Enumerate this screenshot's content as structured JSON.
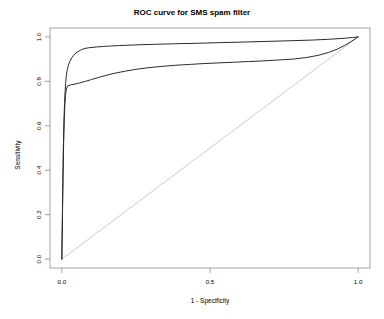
{
  "chart_data": {
    "type": "line",
    "title": "ROC curve for SMS spam filter",
    "xlabel": "1 - Specificity",
    "ylabel": "Sensitivity",
    "xlim": [
      -0.04,
      1.04
    ],
    "ylim": [
      -0.04,
      1.04
    ],
    "grid": false,
    "legend": "none",
    "xticks": [
      "0.0",
      "0.5",
      "1.0"
    ],
    "xtick_values": [
      0.0,
      0.5,
      1.0
    ],
    "yticks": [
      "0.0",
      "0.2",
      "0.4",
      "0.6",
      "0.8",
      "1.0"
    ],
    "ytick_values": [
      0.0,
      0.2,
      0.4,
      0.6,
      0.8,
      1.0
    ],
    "series": [
      {
        "name": "ROC curve A",
        "color": "#2b2b2b",
        "x": [
          0.0,
          0.003,
          0.005,
          0.007,
          0.009,
          0.011,
          0.013,
          0.015,
          0.018,
          0.022,
          0.027,
          0.033,
          0.04,
          0.048,
          0.057,
          0.067,
          0.078,
          0.09,
          0.105,
          0.12,
          0.14,
          0.165,
          0.195,
          0.23,
          0.27,
          0.32,
          0.38,
          0.45,
          0.53,
          0.62,
          0.7,
          0.78,
          0.85,
          0.91,
          0.955,
          0.98,
          1.0
        ],
        "y": [
          0.0,
          0.3,
          0.5,
          0.62,
          0.7,
          0.755,
          0.795,
          0.825,
          0.85,
          0.872,
          0.89,
          0.905,
          0.918,
          0.928,
          0.936,
          0.943,
          0.948,
          0.951,
          0.953,
          0.955,
          0.957,
          0.959,
          0.961,
          0.963,
          0.965,
          0.967,
          0.969,
          0.971,
          0.974,
          0.977,
          0.98,
          0.983,
          0.986,
          0.99,
          0.994,
          0.997,
          1.0
        ]
      },
      {
        "name": "ROC curve B",
        "color": "#2b2b2b",
        "x": [
          0.0,
          0.002,
          0.004,
          0.006,
          0.008,
          0.01,
          0.012,
          0.015,
          0.02,
          0.03,
          0.045,
          0.06,
          0.08,
          0.1,
          0.125,
          0.15,
          0.18,
          0.215,
          0.25,
          0.29,
          0.335,
          0.38,
          0.43,
          0.48,
          0.53,
          0.58,
          0.63,
          0.68,
          0.73,
          0.78,
          0.825,
          0.865,
          0.9,
          0.93,
          0.955,
          0.975,
          0.99,
          1.0
        ],
        "y": [
          0.0,
          0.2,
          0.38,
          0.52,
          0.62,
          0.69,
          0.735,
          0.765,
          0.78,
          0.784,
          0.788,
          0.793,
          0.8,
          0.808,
          0.818,
          0.827,
          0.837,
          0.846,
          0.854,
          0.861,
          0.867,
          0.872,
          0.876,
          0.88,
          0.883,
          0.886,
          0.889,
          0.892,
          0.896,
          0.9,
          0.907,
          0.917,
          0.93,
          0.945,
          0.962,
          0.978,
          0.991,
          1.0
        ]
      }
    ],
    "reference_line": {
      "name": "chance diagonal",
      "color": "#c4c4c4",
      "x": [
        0.0,
        1.0
      ],
      "y": [
        0.0,
        1.0
      ]
    }
  }
}
